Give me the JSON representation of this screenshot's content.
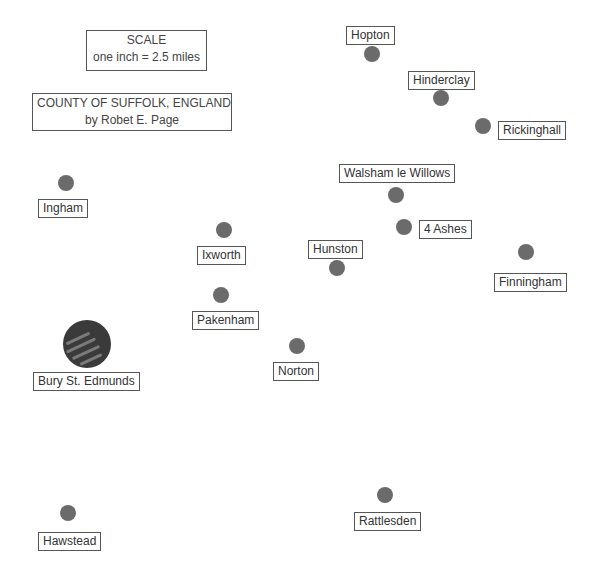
{
  "scale_box": {
    "title": "SCALE",
    "text": "one inch = 2.5 miles"
  },
  "title_box": {
    "line1": "COUNTY OF SUFFOLK, ENGLAND",
    "line2": "by Robet E. Page"
  },
  "colors": {
    "town_dot": "#6b6b6b",
    "major_town": "#3a3a3a",
    "label_border": "#555555"
  },
  "towns": [
    {
      "name": "Hopton",
      "type": "village"
    },
    {
      "name": "Hinderclay",
      "type": "village"
    },
    {
      "name": "Rickinghall",
      "type": "village"
    },
    {
      "name": "Walsham le Willows",
      "type": "village"
    },
    {
      "name": "4 Ashes",
      "type": "village"
    },
    {
      "name": "Ingham",
      "type": "village"
    },
    {
      "name": "Ixworth",
      "type": "village"
    },
    {
      "name": "Hunston",
      "type": "village"
    },
    {
      "name": "Finningham",
      "type": "village"
    },
    {
      "name": "Pakenham",
      "type": "village"
    },
    {
      "name": "Bury St. Edmunds",
      "type": "town"
    },
    {
      "name": "Norton",
      "type": "village"
    },
    {
      "name": "Rattlesden",
      "type": "village"
    },
    {
      "name": "Hawstead",
      "type": "village"
    }
  ]
}
